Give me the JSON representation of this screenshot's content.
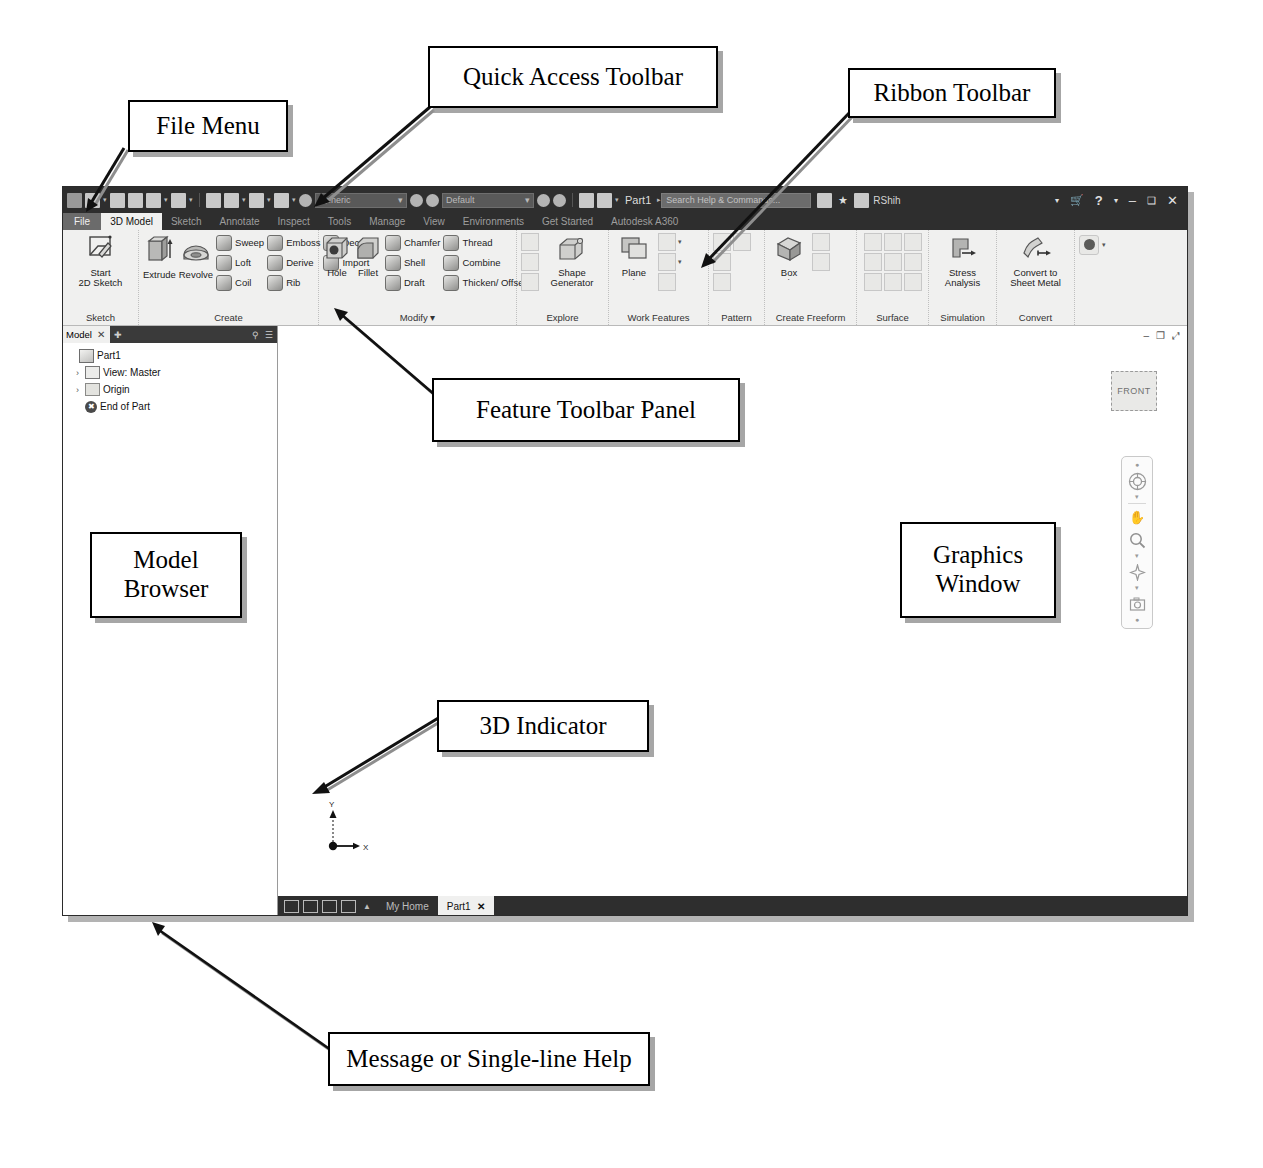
{
  "annotations": [
    {
      "id": "file-menu",
      "label": "File Menu"
    },
    {
      "id": "quick-access-toolbar",
      "label": "Quick Access Toolbar"
    },
    {
      "id": "ribbon-toolbar",
      "label": "Ribbon Toolbar"
    },
    {
      "id": "feature-toolbar-panel",
      "label": "Feature Toolbar Panel"
    },
    {
      "id": "model-browser",
      "label": "Model\nBrowser"
    },
    {
      "id": "graphics-window",
      "label": "Graphics\nWindow"
    },
    {
      "id": "three-d-indicator",
      "label": "3D Indicator"
    },
    {
      "id": "message-help",
      "label": "Message or Single-line Help"
    }
  ],
  "annotation_text": {
    "file_menu": "File Menu",
    "quick_access_toolbar": "Quick Access Toolbar",
    "ribbon_toolbar": "Ribbon Toolbar",
    "feature_toolbar_panel": "Feature Toolbar Panel",
    "model_browser_line1": "Model",
    "model_browser_line2": "Browser",
    "graphics_window_line1": "Graphics",
    "graphics_window_line2": "Window",
    "three_d_indicator": "3D Indicator",
    "message_help": "Message or Single-line Help"
  },
  "titlebar": {
    "document_title": "Part1",
    "material_combo": "Generic",
    "appearance_combo": "Default",
    "search_placeholder": "Search Help & Commands...",
    "user_name": "RShih",
    "minimize": "–",
    "maximize": "❑",
    "close": "✕",
    "help_glyph": "?",
    "star_glyph": "★",
    "dropdown_caret": "▾",
    "qat_icons": [
      "inventor-logo-icon",
      "new-file-icon",
      "open-file-icon",
      "save-icon",
      "undo-icon",
      "redo-icon",
      "home-icon",
      "project-icon",
      "material-icon",
      "appearance-icon",
      "plus-icon",
      "customize-icon"
    ]
  },
  "ribbon_tabs": [
    {
      "label": "File",
      "state": "file"
    },
    {
      "label": "3D Model",
      "state": "active"
    },
    {
      "label": "Sketch",
      "state": "normal"
    },
    {
      "label": "Annotate",
      "state": "normal"
    },
    {
      "label": "Inspect",
      "state": "normal"
    },
    {
      "label": "Tools",
      "state": "normal"
    },
    {
      "label": "Manage",
      "state": "normal"
    },
    {
      "label": "View",
      "state": "normal"
    },
    {
      "label": "Environments",
      "state": "normal"
    },
    {
      "label": "Get Started",
      "state": "normal"
    },
    {
      "label": "Autodesk A360",
      "state": "normal"
    }
  ],
  "ribbon_panels": [
    {
      "title": "Sketch",
      "large": [
        {
          "label": "Start\n2D Sketch",
          "line1": "Start",
          "line2": "2D Sketch",
          "caret": "˙"
        }
      ],
      "small": [],
      "grid": []
    },
    {
      "title": "Create",
      "large": [
        {
          "line1": "Extrude",
          "line2": ""
        },
        {
          "line1": "Revolve",
          "line2": ""
        }
      ],
      "small": [
        [
          "Sweep",
          "Emboss",
          "Decal"
        ],
        [
          "Loft",
          "Derive",
          "Import"
        ],
        [
          "Coil",
          "Rib",
          ""
        ]
      ],
      "grid": []
    },
    {
      "title": "Modify ▾",
      "large": [
        {
          "line1": "Hole",
          "line2": ""
        },
        {
          "line1": "Fillet",
          "line2": ""
        }
      ],
      "small": [
        [
          "Chamfer",
          "Thread"
        ],
        [
          "Shell",
          "Combine"
        ],
        [
          "Draft",
          "Thicken/ Offset"
        ]
      ],
      "grid": []
    },
    {
      "title": "Explore",
      "large": [
        {
          "line1": "Shape",
          "line2": "Generator"
        }
      ],
      "small": [],
      "grid": [
        "split-face-icon",
        "delete-face-icon",
        "replace-face-icon"
      ]
    },
    {
      "title": "Work Features",
      "large": [
        {
          "line1": "Plane",
          "line2": "˙"
        }
      ],
      "small": [],
      "grid": [
        "axis-icon",
        "point-icon",
        "ucs-icon"
      ]
    },
    {
      "title": "Pattern",
      "large": [],
      "small": [],
      "grid": [
        "rectangular-pattern-icon",
        "circular-pattern-icon",
        "mirror-icon",
        "sketch-driven-pattern-icon"
      ]
    },
    {
      "title": "Create Freeform",
      "large": [
        {
          "line1": "Box",
          "line2": "˙"
        }
      ],
      "small": [],
      "grid": [
        "freeform-plane-icon",
        "freeform-sphere-icon"
      ]
    },
    {
      "title": "Surface",
      "large": [],
      "small": [],
      "grid": [
        "stitch-icon",
        "sculpt-icon",
        "patch-icon",
        "trim-icon",
        "extend-icon",
        "ruled-surface-icon",
        "boundary-patch-icon",
        "replace-face-surface-icon",
        "copy-surface-icon"
      ]
    },
    {
      "title": "Simulation",
      "large": [
        {
          "line1": "Stress",
          "line2": "Analysis"
        }
      ],
      "small": [],
      "grid": []
    },
    {
      "title": "Convert",
      "large": [
        {
          "line1": "Convert to",
          "line2": "Sheet Metal"
        }
      ],
      "small": [],
      "grid": []
    },
    {
      "title": "",
      "large": [],
      "small": [],
      "grid": [
        "appearance-override-icon"
      ]
    }
  ],
  "browser": {
    "tab_label": "Model",
    "close_glyph": "✕",
    "pin_glyph": "✚",
    "search_glyph": "⚲",
    "menu_glyph": "☰",
    "tree": [
      {
        "label": "Part1",
        "icon": "part-cube-icon",
        "arrow": "",
        "indent": 0
      },
      {
        "label": "View: Master",
        "icon": "view-icon",
        "arrow": "›",
        "indent": 1
      },
      {
        "label": "Origin",
        "icon": "folder-icon",
        "arrow": "›",
        "indent": 1
      },
      {
        "label": "End of Part",
        "icon": "end-of-part-icon",
        "arrow": "",
        "indent": 1
      }
    ]
  },
  "canvas": {
    "viewcube_label": "FRONT",
    "axis_x_label": "X",
    "axis_y_label": "Y",
    "mini_window_controls": [
      "–",
      "❐",
      "⤢"
    ],
    "nav_items": [
      "full-navigation-wheel-icon",
      "orbit-icon",
      "pan-icon",
      "zoom-icon",
      "look-at-icon",
      "camera-icon",
      "settings-icon"
    ]
  },
  "doc_tabs": {
    "view_icons": [
      "tile-icon",
      "grid-icon",
      "list-icon",
      "split-icon"
    ],
    "expand_glyph": "▲",
    "tabs": [
      {
        "label": "My Home",
        "active": false,
        "closable": false
      },
      {
        "label": "Part1",
        "active": true,
        "closable": true,
        "close_glyph": "✕"
      }
    ]
  },
  "statusbar": {
    "message": "For Help, press F1",
    "cells": [
      "1",
      "1"
    ]
  },
  "colors": {
    "window_chrome": "#2e2e2e",
    "ribbon_bg": "#f0f0ef",
    "canvas_bg": "#ffffff",
    "active_tab_bg": "#f0f0ef",
    "file_tab_bg": "#6b6b6b",
    "callout_border": "#000000"
  }
}
